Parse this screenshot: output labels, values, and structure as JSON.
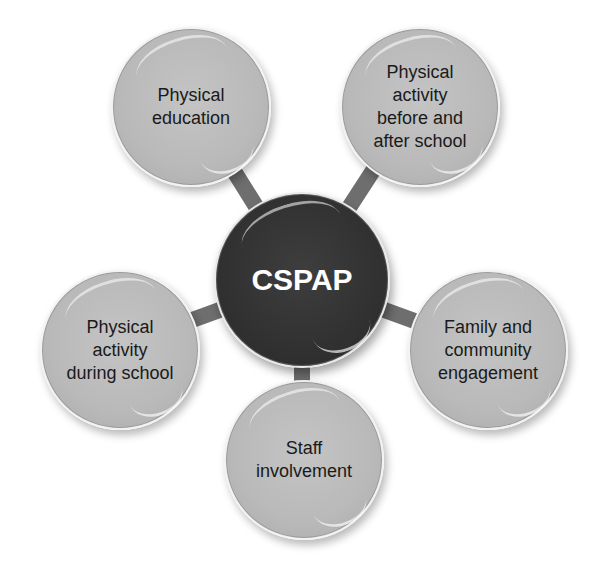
{
  "diagram": {
    "type": "hub-and-spoke",
    "center": {
      "label": "CSPAP",
      "color": "#2f2f2f",
      "text_color": "#ffffff"
    },
    "nodes": [
      {
        "id": "physical-education",
        "label": "Physical\neducation",
        "position": "top-left"
      },
      {
        "id": "before-after-school",
        "label": "Physical\nactivity\nbefore and\nafter school",
        "position": "top-right"
      },
      {
        "id": "during-school",
        "label": "Physical\nactivity\nduring school",
        "position": "left"
      },
      {
        "id": "family-community",
        "label": "Family and\ncommunity\nengagement",
        "position": "right"
      },
      {
        "id": "staff-involvement",
        "label": "Staff\ninvolvement",
        "position": "bottom"
      }
    ],
    "colors": {
      "node_fill": "#bababa",
      "connector": "#6e6e6e",
      "background": "#ffffff"
    }
  }
}
